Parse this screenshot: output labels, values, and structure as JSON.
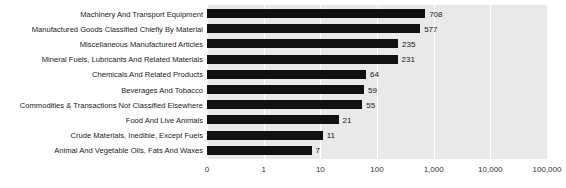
{
  "chart_data": {
    "type": "bar",
    "orientation": "horizontal",
    "title": "",
    "xlabel": "",
    "ylabel": "",
    "xscale": "log",
    "grid": true,
    "legend": null,
    "xticks": [
      "0",
      "1",
      "10",
      "100",
      "1,000",
      "10,000",
      "100,000"
    ],
    "xtick_values": [
      0,
      1,
      10,
      100,
      1000,
      10000,
      100000
    ],
    "categories": [
      "Machinery And Transport Equipment",
      "Manufactured Goods Classified Chiefly By Material",
      "Miscellaneous Manufactured Articles",
      "Mineral Fuels, Lubricants And Related Materials",
      "Chemicals And Related Products",
      "Beverages And Tobacco",
      "Commodities & Transactions Not Classified Elsewhere",
      "Food And Live Animals",
      "Crude Materials, Inedible, Except Fuels",
      "Animal And Vegetable Oils, Fats And Waxes"
    ],
    "values": [
      708,
      577,
      235,
      231,
      64,
      59,
      55,
      21,
      11,
      7
    ],
    "value_labels": [
      "708",
      "577",
      "235",
      "231",
      "64",
      "59",
      "55",
      "21",
      "11",
      "7"
    ],
    "colors": {
      "bar": "#111111",
      "plot_background": "#e9e9e9",
      "gridline": "#ffffff",
      "text": "#1a1a1a",
      "page_background": "#ffffff"
    }
  }
}
